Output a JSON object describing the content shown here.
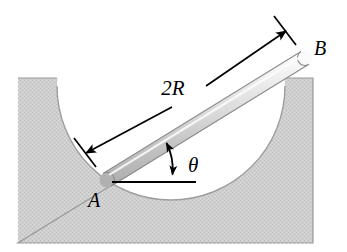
{
  "figure": {
    "background_color": "#ffffff"
  },
  "labels": {
    "length_label": "2R",
    "point_a": "A",
    "point_b": "B",
    "angle_label": "θ"
  },
  "colors": {
    "block_fill": "#c9c9c9",
    "block_edge": "#8a8a8a",
    "cavity_fill": "#ffffff",
    "rod_light": "#f2f2f2",
    "rod_mid": "#d6d6d6",
    "rod_dark": "#b4b4b4",
    "rod_edge": "#7d7d7d",
    "line_color": "#000000"
  },
  "geometry": {
    "block": {
      "left": 18,
      "top": 78,
      "right": 313,
      "bottom": 243
    },
    "cavity": {
      "center_x": 171,
      "center_y": 86,
      "radius": 114
    },
    "rod": {
      "end_a_x": 107,
      "end_a_y": 180,
      "end_b_x": 305,
      "end_b_y": 58,
      "thickness": 14,
      "length_label": "2R"
    },
    "horizontal_reference": {
      "x1": 112,
      "y1": 182,
      "x2": 196,
      "y2": 182
    },
    "angle_arc": {
      "vertex_x": 112,
      "vertex_y": 182,
      "radius": 62,
      "value_label": "θ"
    },
    "dimension_line": {
      "x1": 85,
      "y1": 152,
      "x2": 285,
      "y2": 30,
      "gap_label": "2R"
    }
  },
  "label_positions": {
    "length": {
      "x": 190,
      "y": 95
    },
    "point_a": {
      "x": 95,
      "y": 202
    },
    "point_b": {
      "x": 320,
      "y": 54
    },
    "theta": {
      "x": 192,
      "y": 170
    }
  }
}
